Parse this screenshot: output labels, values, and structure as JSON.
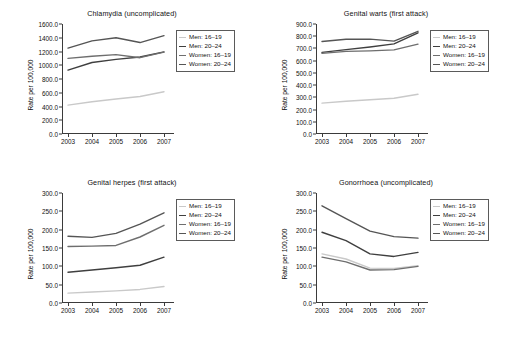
{
  "figure": {
    "axis_label": "Rate per 100,000",
    "x_categories": [
      "2003",
      "2004",
      "2005",
      "2006",
      "2007"
    ],
    "series_names": [
      "Men: 16–19",
      "Men: 20–24",
      "Women: 16–19",
      "Women: 20–24"
    ],
    "series_colors": [
      "#c9c9c9",
      "#3f3f3f",
      "#6e6e6e",
      "#555555"
    ]
  },
  "chart_data": [
    {
      "type": "line",
      "title": "Chlamydia (uncomplicated)",
      "xlabel": "",
      "ylabel": "Rate per 100,000",
      "categories": [
        "2003",
        "2004",
        "2005",
        "2006",
        "2007"
      ],
      "ylim": [
        0,
        1600
      ],
      "yticks": [
        "0.0",
        "200.0",
        "400.0",
        "600.0",
        "800.0",
        "1000.0",
        "1200.0",
        "1400.0",
        "1600.0"
      ],
      "grid": false,
      "legend_position": "right",
      "series": [
        {
          "name": "Men: 16–19",
          "values": [
            420,
            470,
            510,
            545,
            615
          ]
        },
        {
          "name": "Men: 20–24",
          "values": [
            930,
            1040,
            1085,
            1120,
            1195
          ]
        },
        {
          "name": "Women: 16–19",
          "values": [
            1100,
            1130,
            1155,
            1110,
            1190
          ]
        },
        {
          "name": "Women: 20–24",
          "values": [
            1250,
            1355,
            1400,
            1330,
            1430
          ]
        }
      ]
    },
    {
      "type": "line",
      "title": "Genital warts (first attack)",
      "xlabel": "",
      "ylabel": "Rate per 100,000",
      "categories": [
        "2003",
        "2004",
        "2005",
        "2006",
        "2007"
      ],
      "ylim": [
        0,
        900
      ],
      "yticks": [
        "0.0",
        "100.0",
        "200.0",
        "300.0",
        "400.0",
        "500.0",
        "600.0",
        "700.0",
        "800.0",
        "900.0"
      ],
      "grid": false,
      "legend_position": "right",
      "series": [
        {
          "name": "Men: 16–19",
          "values": [
            253,
            268,
            280,
            292,
            325
          ]
        },
        {
          "name": "Men: 20–24",
          "values": [
            668,
            690,
            712,
            737,
            828
          ]
        },
        {
          "name": "Women: 16–19",
          "values": [
            660,
            676,
            680,
            688,
            735
          ]
        },
        {
          "name": "Women: 20–24",
          "values": [
            757,
            775,
            776,
            760,
            840
          ]
        }
      ]
    },
    {
      "type": "line",
      "title": "Genital herpes (first attack)",
      "xlabel": "",
      "ylabel": "Rate per 100,000",
      "categories": [
        "2003",
        "2004",
        "2005",
        "2006",
        "2007"
      ],
      "ylim": [
        0,
        300
      ],
      "yticks": [
        "0.0",
        "50.0",
        "100.0",
        "150.0",
        "200.0",
        "250.0",
        "300.0"
      ],
      "grid": false,
      "legend_position": "right",
      "series": [
        {
          "name": "Men: 16–19",
          "values": [
            27,
            30,
            33,
            37,
            45
          ]
        },
        {
          "name": "Men: 20–24",
          "values": [
            84,
            90,
            96,
            103,
            125
          ]
        },
        {
          "name": "Women: 16–19",
          "values": [
            154,
            155,
            157,
            180,
            212
          ]
        },
        {
          "name": "Women: 20–24",
          "values": [
            182,
            179,
            190,
            215,
            246
          ]
        }
      ]
    },
    {
      "type": "line",
      "title": "Gonorrhoea (uncomplicated)",
      "xlabel": "",
      "ylabel": "Rate per 100,000",
      "categories": [
        "2003",
        "2004",
        "2005",
        "2006",
        "2007"
      ],
      "ylim": [
        0,
        300
      ],
      "yticks": [
        "0.0",
        "50.0",
        "100.0",
        "150.0",
        "200.0",
        "250.0",
        "300.0"
      ],
      "grid": false,
      "legend_position": "right",
      "series": [
        {
          "name": "Men: 16–19",
          "values": [
            134,
            120,
            95,
            94,
            102
          ]
        },
        {
          "name": "Men: 20–24",
          "values": [
            193,
            170,
            134,
            127,
            138
          ]
        },
        {
          "name": "Women: 16–19",
          "values": [
            125,
            112,
            90,
            91,
            100
          ]
        },
        {
          "name": "Women: 20–24",
          "values": [
            265,
            230,
            196,
            181,
            177
          ]
        }
      ]
    }
  ]
}
